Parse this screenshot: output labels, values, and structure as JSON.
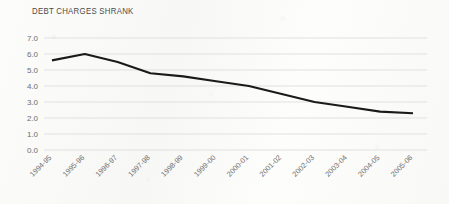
{
  "chart_data": {
    "type": "line",
    "title": "DEBT CHARGES SHRANK",
    "xlabel": "",
    "ylabel": "",
    "categories": [
      "1994-95",
      "1995-96",
      "1996-97",
      "1997-98",
      "1998-99",
      "1999-00",
      "2000-01",
      "2001-02",
      "2002-03",
      "2003-04",
      "2004-05",
      "2005-06"
    ],
    "values": [
      5.6,
      6.0,
      5.5,
      4.8,
      4.6,
      4.3,
      4.0,
      3.5,
      3.0,
      2.7,
      2.4,
      2.3
    ],
    "series": [
      {
        "name": "Debt charges",
        "values": [
          5.6,
          6.0,
          5.5,
          4.8,
          4.6,
          4.3,
          4.0,
          3.5,
          3.0,
          2.7,
          2.4,
          2.3
        ]
      }
    ],
    "ylim": [
      0.0,
      7.0
    ],
    "ytick_labels": [
      "7.0",
      "6.0",
      "5.0",
      "4.0",
      "3.0",
      "2.0",
      "1.0",
      "0.0"
    ],
    "ytick_values": [
      7.0,
      6.0,
      5.0,
      4.0,
      3.0,
      2.0,
      1.0,
      0.0
    ],
    "grid": true,
    "grid_axis": "y",
    "legend": false,
    "legend_position": "none",
    "line_color": "#1a1a1a",
    "grid_color": "#d6d6d4",
    "tick_label_color": "#6d6d6b",
    "title_color": "#4a4a48",
    "background_color": "#fbfbfa",
    "xtick_label_rotation": -45
  }
}
